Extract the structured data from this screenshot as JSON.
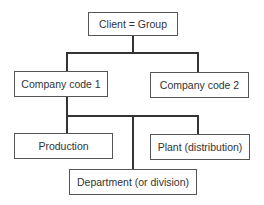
{
  "diagram": {
    "type": "org-hierarchy",
    "nodes": {
      "root": {
        "label": "Client = Group"
      },
      "company_code_1": {
        "label": "Company code 1"
      },
      "company_code_2": {
        "label": "Company code 2"
      },
      "production": {
        "label": "Production"
      },
      "plant": {
        "label": "Plant (distribution)"
      },
      "department": {
        "label": "Department (or division)"
      }
    },
    "edges": [
      [
        "Client = Group",
        "Company code 1"
      ],
      [
        "Client = Group",
        "Company code 2"
      ],
      [
        "Company code 1",
        "Production"
      ],
      [
        "Company code 1",
        "Plant (distribution)"
      ],
      [
        "Company code 1",
        "Department (or division)"
      ]
    ],
    "colors": {
      "line": "#333333",
      "border": "#555555",
      "text": "#333333",
      "background": "#ffffff"
    }
  }
}
